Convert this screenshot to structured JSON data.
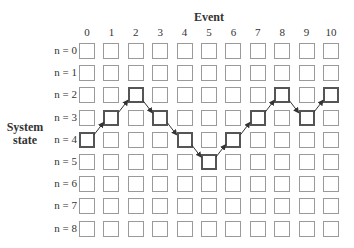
{
  "diagram": {
    "x_axis_title": "Event",
    "y_axis_title_line1": "System",
    "y_axis_title_line2": "state",
    "events": [
      "0",
      "1",
      "2",
      "3",
      "4",
      "5",
      "6",
      "7",
      "8",
      "9",
      "10"
    ],
    "states": [
      "n = 0",
      "n = 1",
      "n = 2",
      "n = 3",
      "n = 4",
      "n = 5",
      "n = 6",
      "n = 7",
      "n = 8"
    ],
    "path_states_by_event": [
      4,
      3,
      2,
      3,
      4,
      5,
      4,
      3,
      2,
      3,
      2
    ],
    "colors": {
      "cell_border": "#9a9a9a",
      "path_border": "#555555",
      "arrow": "#333333",
      "text": "#333333"
    }
  }
}
